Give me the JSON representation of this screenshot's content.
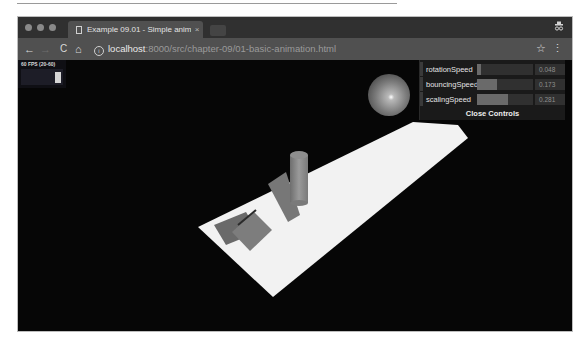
{
  "browser": {
    "tab_title": "Example 09.01 - Simple anim",
    "tab_close": "×",
    "url_host": "localhost",
    "url_path": ":8000/src/chapter-09/01-basic-animation.html",
    "icons": {
      "back": "←",
      "forward": "→",
      "reload": "C",
      "home": "⌂",
      "info": "i",
      "bookmark": "☆",
      "menu": "⋮",
      "incognito": "🕶"
    }
  },
  "stats": {
    "label": "60 FPS (20-60)"
  },
  "controls": {
    "accent": "#6a6a6a",
    "items": [
      {
        "label": "rotationSpeed",
        "value": "0.048",
        "fill_pct": 8
      },
      {
        "label": "bouncingSpeed",
        "value": "0.173",
        "fill_pct": 35
      },
      {
        "label": "scalingSpeed",
        "value": "0.281",
        "fill_pct": 56
      }
    ],
    "close_label": "Close Controls"
  }
}
